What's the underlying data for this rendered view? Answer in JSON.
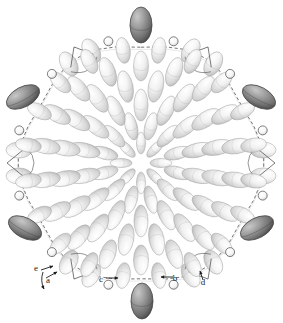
{
  "figure": {
    "background_color": "#ffffff",
    "width": 283,
    "height": 323,
    "view": "down-axis projection showing concentric rosette of displacement ellipsoids surrounded by a dashed macrocyclic ring of atoms",
    "style": {
      "ellipsoid_fill_light": "#f2f2f2",
      "ellipsoid_shade_light": "#c9c9c9",
      "ellipsoid_fill_dark": "#9a9a9a",
      "ellipsoid_shade_dark": "#4a4a4a",
      "ellipsoid_outline": "#a8a8a8",
      "bond_solid_color": "#4d4d4d",
      "bond_dashed_color": "#3d3d3d",
      "atom_circle_stroke": "#555555",
      "label_color": "#1a1a1a"
    }
  },
  "labels": [
    {
      "id": "a",
      "text": "a",
      "x": 48,
      "y": 283,
      "arrow_from": [
        46,
        278
      ],
      "arrow_to": [
        57,
        272
      ]
    },
    {
      "id": "b",
      "text": "b",
      "x": 175,
      "y": 281,
      "arrow_from": [
        173,
        277
      ],
      "arrow_to": [
        161,
        277
      ]
    },
    {
      "id": "c",
      "text": "c",
      "x": 101,
      "y": 282,
      "arrow_from": [
        106,
        278
      ],
      "arrow_to": [
        118,
        278
      ]
    },
    {
      "id": "d",
      "text": "d",
      "x": 203,
      "y": 285,
      "arrow_from": [
        203,
        280
      ],
      "arrow_to": [
        200,
        271
      ]
    },
    {
      "id": "e",
      "text": "e",
      "x": 36,
      "y": 271,
      "arrow_from": [
        41,
        270
      ],
      "arrow_to": [
        53,
        266
      ]
    }
  ],
  "rosette": {
    "center": [
      141,
      163
    ],
    "rings": [
      {
        "index": 0,
        "radius": 20,
        "count": 8,
        "rx": 4.5,
        "ry": 11,
        "phase": 0,
        "tone": "light"
      },
      {
        "index": 1,
        "radius": 38,
        "count": 12,
        "rx": 6.0,
        "ry": 14,
        "phase": 15,
        "tone": "light"
      },
      {
        "index": 2,
        "radius": 58,
        "count": 14,
        "rx": 7.0,
        "ry": 16,
        "phase": 0,
        "tone": "light"
      },
      {
        "index": 3,
        "radius": 78,
        "count": 16,
        "rx": 7.5,
        "ry": 16,
        "phase": 11,
        "tone": "light"
      },
      {
        "index": 4,
        "radius": 97,
        "count": 18,
        "rx": 7.5,
        "ry": 15,
        "phase": 0,
        "tone": "light"
      },
      {
        "index": 5,
        "radius": 114,
        "count": 20,
        "rx": 7.0,
        "ry": 13,
        "phase": 9,
        "tone": "light"
      }
    ],
    "ellipsoid_count_total": 88
  },
  "macrocycle": {
    "radius": 120,
    "node_count": 30,
    "bond_style": "dashed",
    "description": "outer dashed ring tracing the macrocycle backbone"
  },
  "dark_ellipsoids": [
    {
      "id": "top",
      "cx": 141,
      "cy": 25,
      "rx": 11,
      "ry": 18,
      "rot": 0,
      "tone": "dark"
    },
    {
      "id": "bottom",
      "cx": 142,
      "cy": 301,
      "rx": 11,
      "ry": 18,
      "rot": 0,
      "tone": "dark"
    },
    {
      "id": "upper-left",
      "cx": 23,
      "cy": 97,
      "rx": 18,
      "ry": 10,
      "rot": -28,
      "tone": "dark"
    },
    {
      "id": "upper-right",
      "cx": 259,
      "cy": 97,
      "rx": 18,
      "ry": 10,
      "rot": 28,
      "tone": "dark"
    },
    {
      "id": "lower-left",
      "cx": 25,
      "cy": 228,
      "rx": 18,
      "ry": 10,
      "rot": 28,
      "tone": "dark"
    },
    {
      "id": "lower-right",
      "cx": 257,
      "cy": 228,
      "rx": 18,
      "ry": 10,
      "rot": -28,
      "tone": "dark"
    }
  ],
  "substituent_groups": {
    "count": 6,
    "positions_deg": [
      90,
      30,
      330,
      270,
      210,
      150
    ],
    "description": "six peripheral substituent clusters, each with a pair of light ellipsoids, a small loop, and a dark terminal ellipsoid"
  },
  "atom_markers": {
    "count": 12,
    "radius_px": 4.5,
    "description": "small open circles marking backbone heteroatoms on the macrocycle"
  }
}
